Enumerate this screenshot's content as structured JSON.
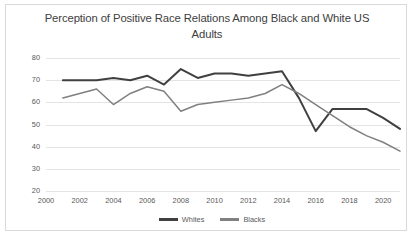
{
  "chart_data": {
    "type": "line",
    "title": "Perception of Positive Race Relations Among Black and White US Adults",
    "xlabel": "",
    "ylabel": "",
    "xlim": [
      2000,
      2021
    ],
    "ylim": [
      20,
      80
    ],
    "grid": true,
    "legend_position": "bottom",
    "xticks": [
      "2000",
      "2002",
      "2004",
      "2006",
      "2008",
      "2010",
      "2012",
      "2014",
      "2016",
      "2018",
      "2020"
    ],
    "yticks": [
      "20",
      "30",
      "40",
      "50",
      "60",
      "70",
      "80"
    ],
    "x": [
      2001,
      2002,
      2003,
      2004,
      2005,
      2006,
      2007,
      2008,
      2009,
      2010,
      2011,
      2012,
      2013,
      2014,
      2015,
      2016,
      2017,
      2018,
      2019,
      2020,
      2021
    ],
    "series": [
      {
        "name": "Whites",
        "color": "#404040",
        "values": [
          70,
          70,
          70,
          71,
          70,
          72,
          68,
          75,
          71,
          73,
          73,
          72,
          73,
          74,
          62,
          47,
          57,
          57,
          57,
          53,
          48
        ]
      },
      {
        "name": "Blacks",
        "color": "#808080",
        "values": [
          62,
          64,
          66,
          59,
          64,
          67,
          65,
          56,
          59,
          60,
          61,
          62,
          64,
          68,
          64,
          59,
          54,
          49,
          45,
          42,
          38
        ]
      }
    ]
  },
  "legend": {
    "entries": [
      {
        "label": "Whites"
      },
      {
        "label": "Blacks"
      }
    ]
  }
}
